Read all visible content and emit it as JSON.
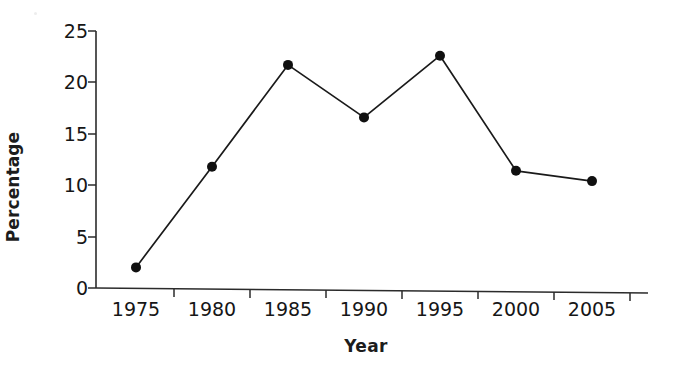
{
  "chart_data": {
    "type": "line",
    "title": "",
    "subtitle": "",
    "xlabel": "Year",
    "ylabel": "Percentage",
    "categories": [
      "1975",
      "1980",
      "1985",
      "1990",
      "1995",
      "2000",
      "2005"
    ],
    "x": [
      1975,
      1980,
      1985,
      1990,
      1995,
      2000,
      2005
    ],
    "values": [
      2.0,
      11.8,
      21.7,
      16.6,
      22.6,
      11.4,
      10.4
    ],
    "series": [
      {
        "name": "Percentage",
        "values": [
          2.0,
          11.8,
          21.7,
          16.6,
          22.6,
          11.4,
          10.4
        ]
      }
    ],
    "ylim": [
      0,
      25
    ],
    "yticks": [
      0,
      5,
      10,
      15,
      20,
      25
    ],
    "ytick_labels": [
      "0",
      "5",
      "10",
      "15",
      "20",
      "25"
    ],
    "xtick_labels": [
      "1975",
      "1980",
      "1985",
      "1990",
      "1995",
      "2000",
      "2005"
    ],
    "grid": false,
    "legend": false,
    "legend_position": "none",
    "marker": "filled-circle",
    "line_color": "#1a1a1a",
    "marker_color": "#101010",
    "axis_color": "#2b2b2b",
    "background_color": "#ffffff"
  },
  "axes": {
    "y_title": "Percentage",
    "x_title": "Year"
  }
}
